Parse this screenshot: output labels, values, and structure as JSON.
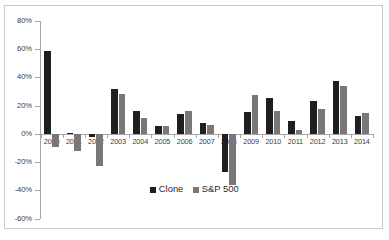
{
  "chart_data": {
    "type": "bar",
    "title": "",
    "xlabel": "",
    "ylabel": "",
    "categories": [
      "2000",
      "2001",
      "2002",
      "2003",
      "2004",
      "2005",
      "2006",
      "2007",
      "2008",
      "2009",
      "2010",
      "2011",
      "2012",
      "2013",
      "2014"
    ],
    "series": [
      {
        "name": "Clone",
        "color": "#1f1f1f",
        "values": [
          58.5,
          0.5,
          -2.0,
          31.5,
          16.5,
          5.5,
          14.0,
          7.5,
          -27.0,
          15.5,
          25.5,
          9.0,
          23.5,
          37.5,
          13.0
        ]
      },
      {
        "name": "S&P 500",
        "color": "#787878",
        "values": [
          -9.0,
          -12.0,
          -22.5,
          28.5,
          11.5,
          5.5,
          16.5,
          6.5,
          -36.0,
          27.5,
          16.5,
          3.0,
          17.5,
          34.0,
          15.0
        ]
      }
    ],
    "ylim": [
      -60,
      80
    ],
    "ytick_values": [
      80,
      60,
      40,
      20,
      0,
      -20,
      -40,
      -60
    ],
    "ytick_labels": [
      "80%",
      "60%",
      "40%",
      "20%",
      "0%",
      "-20%",
      "-40%",
      "-60%"
    ],
    "grid": false,
    "legend_position": "inside-bottom-center"
  },
  "legend": {
    "items": [
      {
        "label": "Clone",
        "swatch": "clone"
      },
      {
        "label": "S&P 500",
        "swatch": "sp500"
      }
    ]
  }
}
